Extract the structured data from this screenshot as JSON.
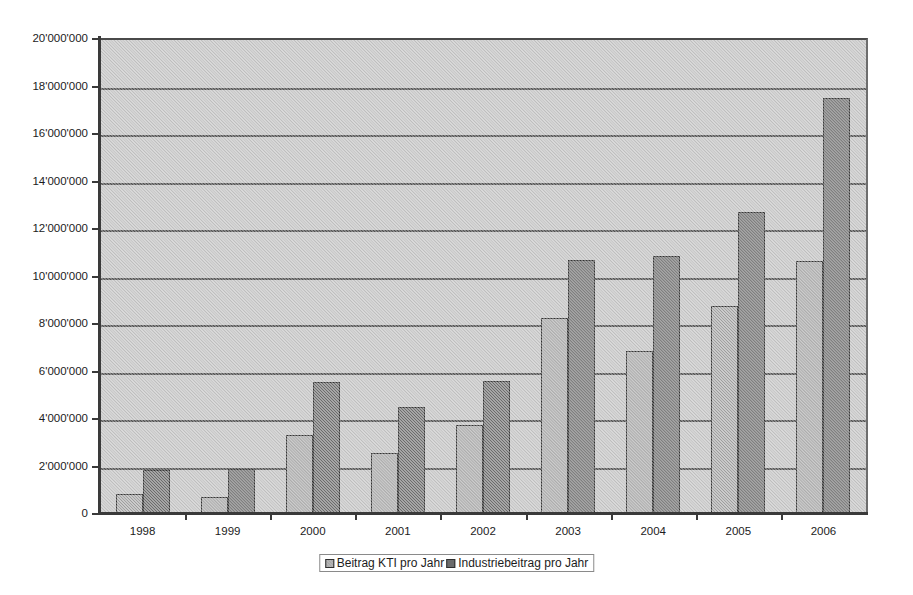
{
  "chart_data": {
    "type": "bar",
    "title": "",
    "subtitle": "",
    "xlabel": "",
    "ylabel": "",
    "categories": [
      "1998",
      "1999",
      "2000",
      "2001",
      "2002",
      "2003",
      "2004",
      "2005",
      "2006"
    ],
    "series": [
      {
        "name": "Beitrag KTI pro Jahr",
        "color": "#a2a2a2",
        "values": [
          900000,
          750000,
          3350000,
          2600000,
          3800000,
          8300000,
          6900000,
          8800000,
          10700000
        ]
      },
      {
        "name": "Industriebeitrag pro Jahr",
        "color": "#6b6b6b",
        "values": [
          1880000,
          1950000,
          5600000,
          4550000,
          5650000,
          10750000,
          10900000,
          12750000,
          17550000
        ]
      }
    ],
    "ylim": [
      0,
      20000000
    ],
    "ytick_step": 2000000,
    "ytick_labels": [
      "0",
      "2'000'000",
      "4'000'000",
      "6'000'000",
      "8'000'000",
      "10'000'000",
      "12'000'000",
      "14'000'000",
      "16'000'000",
      "18'000'000",
      "20'000'000"
    ],
    "grid": "horizontal",
    "legend_position": "bottom",
    "plot_background": "#c9c9c9",
    "figure_background": "#ffffff",
    "axis_color": "#3a3a3a",
    "gridline_color": "#4f4f4f"
  }
}
